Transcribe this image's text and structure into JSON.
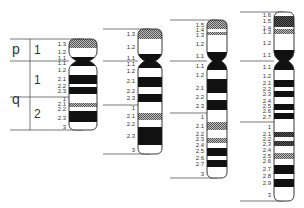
{
  "diagram": {
    "type": "chromosome-ideogram",
    "arm_labels": {
      "p": "p",
      "q": "q"
    },
    "region_labels": {
      "p1": "1",
      "q1": "1",
      "q2": "2"
    },
    "colors": {
      "dark": "#111111",
      "light": "#ffffff",
      "stripe": "#6e6e6e",
      "line": "#555555"
    },
    "chromosomes": [
      {
        "resolution": "low",
        "x": 69,
        "w": 28,
        "top": 39,
        "centromere": 61,
        "bottom": 130,
        "lines": [
          39,
          61,
          97,
          130
        ],
        "line_x0": 10,
        "bands": [
          {
            "label": "1.3",
            "y": 44
          },
          {
            "label": "1.2",
            "y": 52
          },
          {
            "label": "1.1",
            "y": 58
          },
          {
            "label": "1.1",
            "y": 63
          },
          {
            "label": "1.2",
            "y": 70
          },
          {
            "label": "2.1",
            "y": 79
          },
          {
            "label": "2.2",
            "y": 86
          },
          {
            "label": "2.3",
            "y": 91
          },
          {
            "label": "1",
            "y": 99
          },
          {
            "label": "2.1",
            "y": 104
          },
          {
            "label": "2.2",
            "y": 109
          },
          {
            "label": "2.3",
            "y": 118
          },
          {
            "label": "3",
            "y": 127
          }
        ],
        "fills": [
          {
            "y0": 39,
            "y1": 48,
            "style": "stripe"
          },
          {
            "y0": 57,
            "y1": 66,
            "style": "dark"
          },
          {
            "y0": 75,
            "y1": 84,
            "style": "dark"
          },
          {
            "y0": 87,
            "y1": 94,
            "style": "dark"
          },
          {
            "y0": 103,
            "y1": 107,
            "style": "stripe"
          },
          {
            "y0": 111,
            "y1": 122,
            "style": "dark"
          }
        ]
      },
      {
        "resolution": "medium",
        "x": 138,
        "w": 24,
        "top": 29,
        "centromere": 61,
        "bottom": 154,
        "lines": [
          29,
          61,
          105,
          154
        ],
        "line_x0": 103,
        "bands": [
          {
            "label": "1.3",
            "y": 34
          },
          {
            "label": "1.2",
            "y": 47
          },
          {
            "label": "1.1",
            "y": 58
          },
          {
            "label": "1.1",
            "y": 64
          },
          {
            "label": "1.2",
            "y": 71
          },
          {
            "label": "2.1",
            "y": 81
          },
          {
            "label": "2.2",
            "y": 91
          },
          {
            "label": "2.3",
            "y": 98
          },
          {
            "label": "1",
            "y": 108
          },
          {
            "label": "2.1",
            "y": 116
          },
          {
            "label": "2.2",
            "y": 124
          },
          {
            "label": "2.3",
            "y": 136
          },
          {
            "label": "3",
            "y": 150
          }
        ],
        "fills": [
          {
            "y0": 29,
            "y1": 39,
            "style": "stripe"
          },
          {
            "y0": 54,
            "y1": 68,
            "style": "dark"
          },
          {
            "y0": 77,
            "y1": 87,
            "style": "dark"
          },
          {
            "y0": 94,
            "y1": 102,
            "style": "dark"
          },
          {
            "y0": 113,
            "y1": 120,
            "style": "stripe"
          },
          {
            "y0": 127,
            "y1": 145,
            "style": "dark"
          }
        ]
      },
      {
        "resolution": "high",
        "x": 207,
        "w": 20,
        "top": 20,
        "centromere": 61,
        "bottom": 178,
        "lines": [
          20,
          61,
          113,
          178
        ],
        "line_x0": 170,
        "bands": [
          {
            "label": "1.5",
            "y": 25
          },
          {
            "label": "1.4",
            "y": 30
          },
          {
            "label": "1.3",
            "y": 35
          },
          {
            "label": "1.2",
            "y": 44
          },
          {
            "label": "1.1",
            "y": 56
          },
          {
            "label": "1.1",
            "y": 66
          },
          {
            "label": "1.2",
            "y": 75
          },
          {
            "label": "2.1",
            "y": 88
          },
          {
            "label": "2.2",
            "y": 97
          },
          {
            "label": "2.3",
            "y": 106
          },
          {
            "label": "1",
            "y": 117
          },
          {
            "label": "2.1",
            "y": 126
          },
          {
            "label": "2.2",
            "y": 134
          },
          {
            "label": "2.3",
            "y": 139
          },
          {
            "label": "2.4",
            "y": 145
          },
          {
            "label": "2.5",
            "y": 151
          },
          {
            "label": "2.6",
            "y": 158
          },
          {
            "label": "2.7",
            "y": 164
          },
          {
            "label": "3",
            "y": 174
          }
        ],
        "fills": [
          {
            "y0": 20,
            "y1": 29,
            "style": "stripe"
          },
          {
            "y0": 32,
            "y1": 35,
            "style": "stripe"
          },
          {
            "y0": 52,
            "y1": 70,
            "style": "dark"
          },
          {
            "y0": 79,
            "y1": 93,
            "style": "dark"
          },
          {
            "y0": 100,
            "y1": 110,
            "style": "dark"
          },
          {
            "y0": 122,
            "y1": 130,
            "style": "stripe"
          },
          {
            "y0": 138,
            "y1": 143,
            "style": "stripe"
          },
          {
            "y0": 148,
            "y1": 156,
            "style": "dark"
          },
          {
            "y0": 160,
            "y1": 167,
            "style": "dark"
          }
        ]
      },
      {
        "resolution": "very-high",
        "x": 274,
        "w": 20,
        "top": 12,
        "centromere": 61,
        "bottom": 201,
        "lines": [
          12,
          61,
          122,
          201
        ],
        "line_x0": 240,
        "bands": [
          {
            "label": "1.6",
            "y": 15
          },
          {
            "label": "1.5",
            "y": 21
          },
          {
            "label": "1.4",
            "y": 28
          },
          {
            "label": "1.3",
            "y": 32
          },
          {
            "label": "1.2",
            "y": 43
          },
          {
            "label": "1.1",
            "y": 55
          },
          {
            "label": "1.1",
            "y": 67
          },
          {
            "label": "1.2",
            "y": 76
          },
          {
            "label": "2.1",
            "y": 83
          },
          {
            "label": "2.2",
            "y": 89
          },
          {
            "label": "2.3",
            "y": 94
          },
          {
            "label": "2.4",
            "y": 101
          },
          {
            "label": "2.5",
            "y": 106
          },
          {
            "label": "2.6",
            "y": 111
          },
          {
            "label": "2.7",
            "y": 117
          },
          {
            "label": "1",
            "y": 127
          },
          {
            "label": "2.1",
            "y": 134
          },
          {
            "label": "2.2",
            "y": 139
          },
          {
            "label": "2.3",
            "y": 144
          },
          {
            "label": "2.4",
            "y": 150
          },
          {
            "label": "2.5",
            "y": 156
          },
          {
            "label": "2.6",
            "y": 161
          },
          {
            "label": "2.7",
            "y": 169
          },
          {
            "label": "2.8",
            "y": 176
          },
          {
            "label": "2.9",
            "y": 183
          },
          {
            "label": "3",
            "y": 195
          }
        ],
        "fills": [
          {
            "y0": 12,
            "y1": 16,
            "style": "light"
          },
          {
            "y0": 16,
            "y1": 27,
            "style": "stripe-dark"
          },
          {
            "y0": 29,
            "y1": 34,
            "style": "stripe"
          },
          {
            "y0": 50,
            "y1": 70,
            "style": "dark"
          },
          {
            "y0": 80,
            "y1": 87,
            "style": "dark"
          },
          {
            "y0": 91,
            "y1": 97,
            "style": "dark"
          },
          {
            "y0": 104,
            "y1": 110,
            "style": "dark"
          },
          {
            "y0": 113,
            "y1": 119,
            "style": "dark"
          },
          {
            "y0": 132,
            "y1": 137,
            "style": "stripe-dark"
          },
          {
            "y0": 141,
            "y1": 146,
            "style": "stripe-dark"
          },
          {
            "y0": 153,
            "y1": 159,
            "style": "stripe"
          },
          {
            "y0": 165,
            "y1": 174,
            "style": "dark"
          },
          {
            "y0": 179,
            "y1": 187,
            "style": "dark"
          }
        ]
      }
    ]
  }
}
